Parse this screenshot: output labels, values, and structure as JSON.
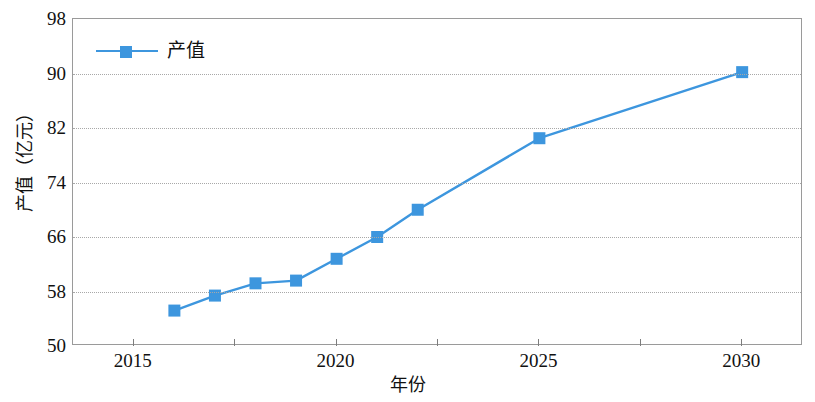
{
  "chart_data": {
    "type": "line",
    "title": "",
    "xlabel": "年份",
    "ylabel": "产值（亿元）",
    "xlim": [
      2013.5,
      2031.5
    ],
    "ylim": [
      50,
      98
    ],
    "yticks": [
      98,
      90,
      82,
      74,
      66,
      58,
      50
    ],
    "xticks": [
      2015,
      2020,
      2025,
      2030
    ],
    "grid": true,
    "legend_position": "top-left",
    "series": [
      {
        "name": "产值",
        "color": "#3D96DE",
        "marker": "square",
        "x": [
          2016,
          2017,
          2018,
          2019,
          2020,
          2021,
          2022,
          2025,
          2030
        ],
        "values": [
          55.2,
          57.4,
          59.2,
          59.6,
          62.8,
          66.0,
          70.0,
          80.5,
          90.2
        ]
      }
    ]
  },
  "axes": {
    "y_tick_labels": [
      "98",
      "90",
      "82",
      "74",
      "66",
      "58",
      "50"
    ],
    "x_tick_labels": [
      "2015",
      "2020",
      "2025",
      "2030"
    ],
    "y_title": "产值（亿元）",
    "x_title": "年份"
  },
  "legend": {
    "entries": [
      {
        "label": "产值",
        "color": "#3D96DE"
      }
    ]
  },
  "colors": {
    "series": "#3D96DE",
    "grid": "#a8a8a8",
    "frame": "#9a9a9a",
    "text": "#111111",
    "background": "#ffffff"
  }
}
